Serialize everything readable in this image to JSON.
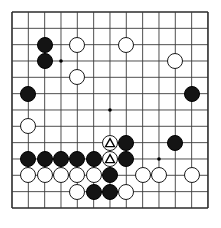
{
  "app": {
    "title": "Go Board Diagram",
    "board_type": "go-board",
    "grid_size": 13
  },
  "board": {
    "columns": 13,
    "rows": 13,
    "background_color": "#ffffff",
    "line_color": "#3c3c3c",
    "border_color": "#2b2b2b",
    "left": 12,
    "top": 10,
    "spacing": 16.33,
    "star_points": [
      {
        "col": 4,
        "row": 4
      },
      {
        "col": 7,
        "row": 7
      },
      {
        "col": 10,
        "row": 10
      }
    ]
  },
  "stones": {
    "black_color": "#141414",
    "white_color": "#ffffff",
    "black": [
      {
        "col": 3,
        "row": 3
      },
      {
        "col": 3,
        "row": 4
      },
      {
        "col": 2,
        "row": 6
      },
      {
        "col": 12,
        "row": 6
      },
      {
        "col": 8,
        "row": 9
      },
      {
        "col": 11,
        "row": 9
      },
      {
        "col": 2,
        "row": 10
      },
      {
        "col": 3,
        "row": 10
      },
      {
        "col": 4,
        "row": 10
      },
      {
        "col": 5,
        "row": 10
      },
      {
        "col": 6,
        "row": 10
      },
      {
        "col": 8,
        "row": 10
      },
      {
        "col": 7,
        "row": 11
      },
      {
        "col": 6,
        "row": 12
      },
      {
        "col": 7,
        "row": 12
      }
    ],
    "white": [
      {
        "col": 5,
        "row": 3
      },
      {
        "col": 8,
        "row": 3
      },
      {
        "col": 11,
        "row": 4
      },
      {
        "col": 5,
        "row": 5
      },
      {
        "col": 2,
        "row": 8
      },
      {
        "col": 2,
        "row": 11
      },
      {
        "col": 3,
        "row": 11
      },
      {
        "col": 4,
        "row": 11
      },
      {
        "col": 5,
        "row": 11
      },
      {
        "col": 6,
        "row": 11
      },
      {
        "col": 9,
        "row": 11
      },
      {
        "col": 10,
        "row": 11
      },
      {
        "col": 12,
        "row": 11
      },
      {
        "col": 5,
        "row": 12
      },
      {
        "col": 8,
        "row": 12
      }
    ],
    "marked_white_triangle": [
      {
        "col": 7,
        "row": 9,
        "mark": "triangle"
      },
      {
        "col": 7,
        "row": 10,
        "mark": "triangle"
      }
    ]
  },
  "legend": {
    "triangle_mark_label": "triangle-marked stone",
    "black_label": "black stone",
    "white_label": "white stone"
  }
}
